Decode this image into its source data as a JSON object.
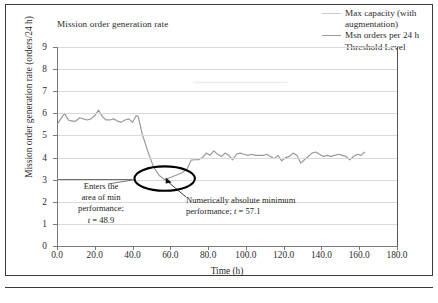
{
  "figure": {
    "title": "Mission order generation rate"
  },
  "legend": {
    "items": [
      {
        "label": "Max capacity (with augmentation)",
        "color": "#c9c9c9",
        "icon": "line-swatch-icon"
      },
      {
        "label": "Msn orders per 24 h",
        "color": "#9a9a9a",
        "icon": "line-swatch-icon"
      },
      {
        "label": "Threshold Level",
        "color": "#6d6d6d",
        "icon": "line-swatch-icon"
      }
    ]
  },
  "annotations": [
    {
      "name": "enters-min-performance",
      "line1": "Enters the",
      "line2": "area of min",
      "line3": "performance;",
      "var": "t",
      "eq": " = 48.9"
    },
    {
      "name": "absolute-minimum",
      "line1": "Numerically absolute minimum",
      "line2": "performance;",
      "var": "t",
      "eq": " = 57.1"
    }
  ],
  "chart_data": {
    "type": "line",
    "title": "Mission order generation rate",
    "xlabel": "Time (h)",
    "ylabel": "Mission order generation rate (orders/24 h)",
    "xlim": [
      0,
      180
    ],
    "ylim": [
      0,
      9
    ],
    "xticks": [
      "0.0",
      "20.0",
      "40.0",
      "60.0",
      "80.0",
      "100.0",
      "120.0",
      "140.0",
      "160.0",
      "180.0"
    ],
    "xtick_values": [
      0,
      20,
      40,
      60,
      80,
      100,
      120,
      140,
      160,
      180
    ],
    "yticks": [
      "0",
      "1",
      "2",
      "3",
      "4",
      "5",
      "6",
      "7",
      "8",
      "9"
    ],
    "ytick_values": [
      0,
      1,
      2,
      3,
      4,
      5,
      6,
      7,
      8,
      9
    ],
    "grid": true,
    "grid_axis": "y",
    "legend_position": "top-right-outside",
    "series": [
      {
        "name": "Max capacity (with augmentation)",
        "color": "#c9c9c9",
        "style": "flat-line",
        "x": [
          0,
          130
        ],
        "values": [
          9.0,
          9.0
        ]
      },
      {
        "name": "Faint upper segment",
        "color": "#ededed",
        "style": "flat-line",
        "x": [
          72,
          122
        ],
        "values": [
          7.4,
          7.4
        ]
      },
      {
        "name": "Threshold Level",
        "color": "#6d6d6d",
        "style": "flat-line",
        "x": [
          0,
          40
        ],
        "values": [
          3.0,
          3.0
        ]
      },
      {
        "name": "Msn orders per 24 h",
        "color": "#9a9a9a",
        "style": "line",
        "x": [
          0,
          2,
          4,
          6,
          8,
          10,
          12,
          14,
          16,
          18,
          20,
          22,
          24,
          26,
          28,
          30,
          32,
          34,
          36,
          38,
          40,
          42,
          43,
          45,
          48,
          51,
          54,
          57,
          60,
          63,
          66,
          69,
          71,
          73,
          75,
          77,
          79,
          81,
          83,
          85,
          87,
          89,
          91,
          93,
          95,
          97,
          99,
          101,
          103,
          105,
          107,
          109,
          111,
          113,
          115,
          117,
          119,
          121,
          123,
          125,
          127,
          129,
          131,
          133,
          135,
          137,
          139,
          141,
          143,
          145,
          147,
          149,
          151,
          153,
          155,
          157,
          159,
          161,
          163
        ],
        "values": [
          5.5,
          5.75,
          6.0,
          5.7,
          5.65,
          5.65,
          5.8,
          5.75,
          5.7,
          5.75,
          5.9,
          6.15,
          5.85,
          5.7,
          5.7,
          5.75,
          5.65,
          5.6,
          5.7,
          5.75,
          5.6,
          5.9,
          5.85,
          5.1,
          4.3,
          3.6,
          3.2,
          3.0,
          3.1,
          3.2,
          3.3,
          3.5,
          3.88,
          3.9,
          3.9,
          4.0,
          4.2,
          4.1,
          4.3,
          4.15,
          4.05,
          4.2,
          4.1,
          3.9,
          4.15,
          4.2,
          4.15,
          4.1,
          4.15,
          4.1,
          4.1,
          4.1,
          4.15,
          4.05,
          3.95,
          4.1,
          3.85,
          4.0,
          4.05,
          4.2,
          4.1,
          3.75,
          3.9,
          4.05,
          4.2,
          4.25,
          4.15,
          4.05,
          4.1,
          4.05,
          4.1,
          4.15,
          4.1,
          4.05,
          3.9,
          4.05,
          4.15,
          4.1,
          4.25
        ]
      }
    ],
    "markers": [
      {
        "name": "minimum-ellipse",
        "cx": 57.0,
        "cy": 3.05,
        "rx_h": 16.0,
        "ry_v": 0.55
      }
    ]
  }
}
